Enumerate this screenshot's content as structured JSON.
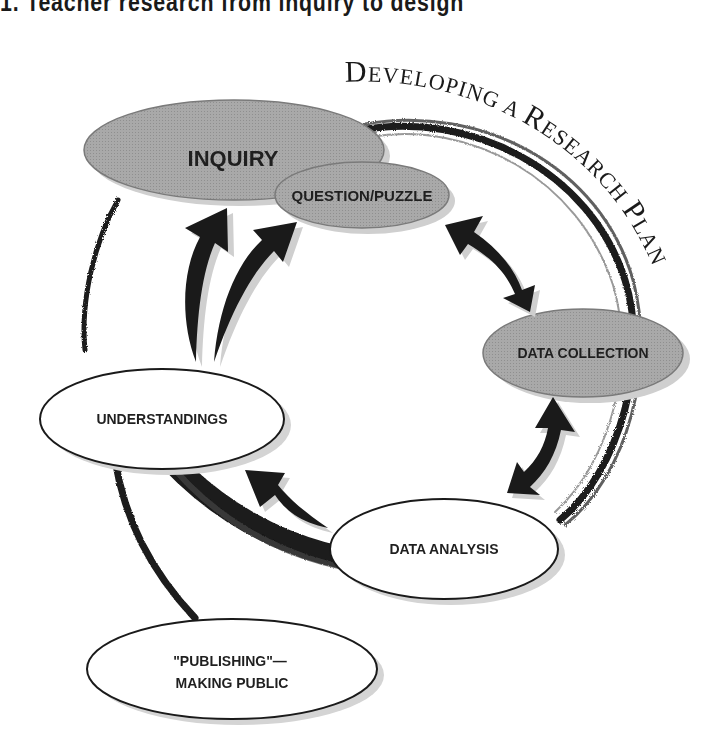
{
  "figure": {
    "title": "1.  Teacher research from inquiry to design",
    "arc_caption": {
      "text_big_1": "D",
      "text_small_1": "EVELOPING ",
      "text_big_2": "A ",
      "text_big_3": "R",
      "text_small_3": "ESEARCH ",
      "text_big_4": "P",
      "text_small_4": "LAN"
    }
  },
  "nodes": {
    "inquiry": {
      "label": "INQUIRY",
      "fill": "#a8a8a8"
    },
    "question": {
      "label": "QUESTION/PUZZLE",
      "fill": "#a8a8a8"
    },
    "data_collection": {
      "label": "DATA COLLECTION",
      "fill": "#a8a8a8"
    },
    "data_analysis": {
      "label": "DATA ANALYSIS",
      "fill": "#ffffff"
    },
    "understandings": {
      "label": "UNDERSTANDINGS",
      "fill": "#ffffff"
    },
    "publishing": {
      "label_line1": "\"PUBLISHING\"—",
      "label_line2": "MAKING PUBLIC",
      "fill": "#ffffff"
    }
  },
  "connections": [
    {
      "from": "question",
      "to": "data_collection",
      "type": "double-arrow"
    },
    {
      "from": "data_collection",
      "to": "data_analysis",
      "type": "double-arrow"
    },
    {
      "from": "data_analysis",
      "to": "understandings",
      "type": "arrow"
    },
    {
      "from": "understandings",
      "to": "inquiry",
      "type": "arrow"
    },
    {
      "from": "understandings",
      "to": "question",
      "type": "arrow"
    },
    {
      "from": "understandings",
      "to": "publishing",
      "type": "brush-line"
    }
  ],
  "colors": {
    "ink": "#1a1a1a",
    "shadow": "#cfcfcf",
    "gray_node": "#a8a8a8"
  }
}
